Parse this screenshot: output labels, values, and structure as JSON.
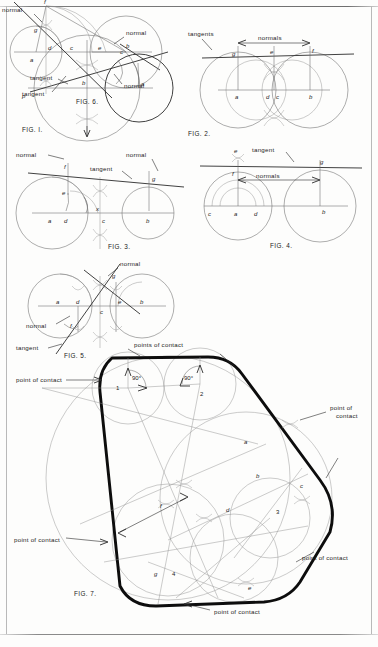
{
  "page": {
    "kind": "engineering-drawing-plate",
    "background_color": "#fdfdfc",
    "line_color": "#1b1b1b",
    "construction_color": "#9a9a9a",
    "heavy_outline_color": "#0d0d0d"
  },
  "figures": [
    {
      "id": "fig1",
      "caption": "FIG. I.",
      "labels": {
        "tangent": "tangent",
        "normal": "normal",
        "p": "p",
        "b": "b",
        "a": "a",
        "c": "c"
      }
    },
    {
      "id": "fig2",
      "caption": "FIG. 2.",
      "labels": {
        "tangents": "tangents",
        "normals": "normals",
        "g": "g",
        "e": "e",
        "f": "f",
        "a": "a",
        "d": "d",
        "c": "c",
        "b": "b"
      }
    },
    {
      "id": "fig3",
      "caption": "FIG. 3.",
      "labels": {
        "normal_left": "normal",
        "normal_right": "normal",
        "tangent": "tangent",
        "f": "f",
        "g": "g",
        "e": "e",
        "a": "a",
        "d": "d",
        "x": "x",
        "c": "c",
        "b": "b"
      }
    },
    {
      "id": "fig4",
      "caption": "FIG. 4.",
      "labels": {
        "tangent": "tangent",
        "normals": "normals",
        "e": "e",
        "f": "f",
        "g": "g",
        "c": "c",
        "a": "a",
        "d": "d",
        "b": "b"
      }
    },
    {
      "id": "fig5",
      "caption": "FIG. 5.",
      "labels": {
        "normal_top": "normal",
        "normal_left": "normal",
        "tangent": "tangent",
        "g": "g",
        "a": "a",
        "d": "d",
        "c": "c",
        "e": "e",
        "b": "b",
        "f": "f"
      }
    },
    {
      "id": "fig6",
      "caption": "FIG. 6.",
      "labels": {
        "normal_top": "normal",
        "normal_right": "normal",
        "tangent": "tangent",
        "f": "f",
        "g": "g",
        "a": "a",
        "d": "d",
        "c": "c",
        "e": "e",
        "b": "b"
      }
    },
    {
      "id": "fig7",
      "caption": "FIG. 7.",
      "labels": {
        "points_of_contact_top": "points of contact",
        "point_of_contact_left": "point of contact",
        "point_of_contact_right": "point of\ncontact",
        "point_of_contact_right_lower": "point of contact",
        "point_of_contact_bottom_left": "point of contact",
        "point_of_contact_bottom": "point of contact",
        "angle_1": "90°",
        "angle_2": "90°",
        "n1": "1",
        "n2": "2",
        "n3": "3",
        "n4": "4",
        "a": "a",
        "b": "b",
        "c": "c",
        "d": "d",
        "e": "e",
        "f": "f",
        "g": "g"
      }
    }
  ],
  "fig7_right_label_lines": [
    "point of",
    "contact"
  ]
}
